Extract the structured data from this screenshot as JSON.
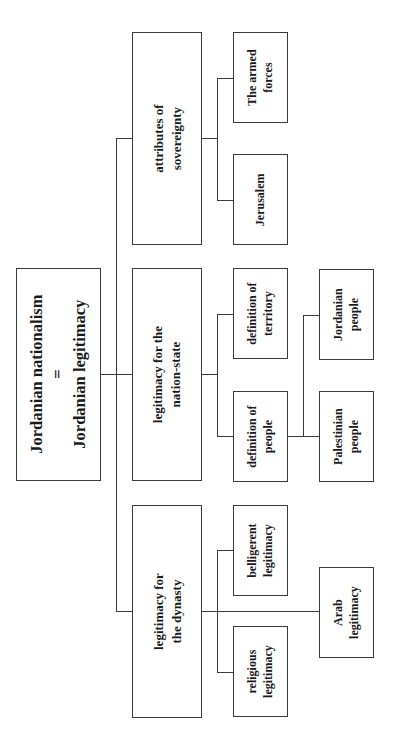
{
  "diagram": {
    "orientation": "rotated 90deg counter-clockwise (tree grows left to right on page)",
    "root": {
      "line1": "Jordanian nationalism",
      "line2": "=",
      "line3": "Jordanian legitimacy"
    },
    "branches": [
      {
        "id": "sovereignty",
        "line1": "attributes of",
        "line2": "sovereignty",
        "children": [
          {
            "line1": "The armed",
            "line2": "forces"
          },
          {
            "line1": "Jerusalem",
            "line2": ""
          }
        ]
      },
      {
        "id": "nation-state",
        "line1": "legitimacy for the",
        "line2": "nation-state",
        "children": [
          {
            "line1": "definition of",
            "line2": "territory"
          },
          {
            "line1": "definition of",
            "line2": "people",
            "children": [
              {
                "line1": "Jordanian",
                "line2": "people"
              },
              {
                "line1": "Palestinian",
                "line2": "people"
              }
            ]
          }
        ]
      },
      {
        "id": "dynasty",
        "line1": "legitimacy for",
        "line2": "the dynasty",
        "children": [
          {
            "line1": "belligerent",
            "line2": "legitimacy"
          },
          {
            "line1": "religious",
            "line2": "legitimacy"
          },
          {
            "line1": "Arab",
            "line2": "legitimacy"
          }
        ]
      }
    ]
  },
  "colors": {
    "line": "#3a3a3a",
    "text": "#1a1a1a",
    "background": "#ffffff"
  }
}
